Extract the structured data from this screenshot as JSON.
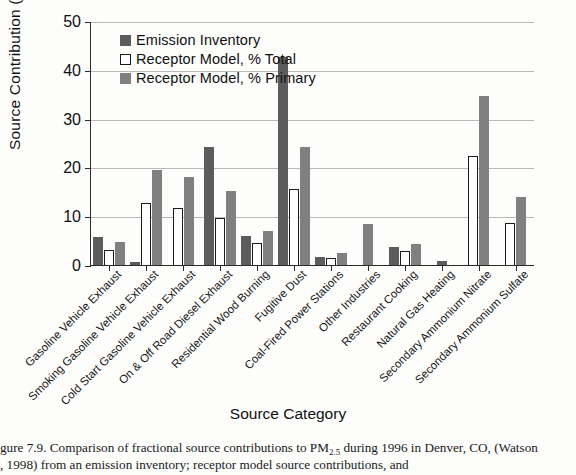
{
  "figure": {
    "caption_prefix": "gure 7.9.",
    "caption_text": "  Comparison of fractional source contributions to PM",
    "caption_sub": "2.5",
    "caption_text2": " during 1996 in Denver, CO, (Watson",
    "caption_line2": ", 1998) from an emission inventory; receptor model source contributions, and"
  },
  "chart_data": {
    "type": "bar",
    "title": "",
    "xlabel": "Source Category",
    "ylabel": "Source Contribution   (%)",
    "ylim": [
      0,
      50
    ],
    "yticks": [
      0,
      10,
      20,
      30,
      40,
      50
    ],
    "ytick_labels": [
      "0",
      "10",
      "20",
      "30",
      "40",
      "50"
    ],
    "grid": true,
    "legend_position": "upper-left-inside",
    "categories": [
      "Gasoline Vehicle Exhaust",
      "Smoking Gasoline Vehicle Exhaust",
      "Cold Start Gasoline Vehicle Exhaust",
      "On & Off Road Diesel Exhaust",
      "Residential Wood Burning",
      "Fugitive Dust",
      "Coal-Fired Power Stations",
      "Other Industries",
      "Restaurant Cooking",
      "Natural Gas Heating",
      "Secondary Ammonium Nitrate",
      "Secondary Ammonium Sulfate"
    ],
    "series": [
      {
        "name": "Emission Inventory",
        "color": "#5c5c5c",
        "values": [
          5.8,
          0.6,
          null,
          24.1,
          5.9,
          42.7,
          1.6,
          null,
          3.7,
          0.8,
          null,
          null
        ]
      },
      {
        "name": "Receptor Model, % Total",
        "color": "#ffffff",
        "values": [
          3.1,
          12.7,
          11.7,
          9.7,
          4.6,
          15.6,
          1.5,
          null,
          2.8,
          null,
          22.4,
          8.6
        ]
      },
      {
        "name": "Receptor Model, % Primary",
        "color": "#808080",
        "values": [
          4.8,
          19.5,
          18.1,
          15.1,
          6.9,
          24.2,
          2.4,
          8.5,
          4.3,
          null,
          34.7,
          13.9
        ]
      }
    ]
  }
}
